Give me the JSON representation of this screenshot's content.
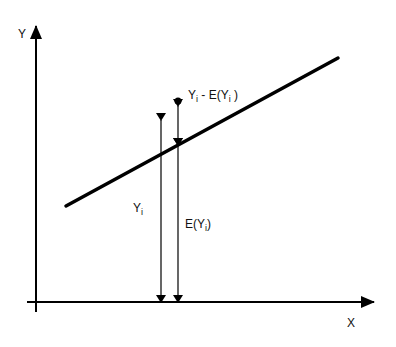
{
  "diagram": {
    "axes": {
      "y_label": "Y",
      "x_label": "X"
    },
    "regression_line": {
      "start": [
        66,
        206
      ],
      "end": [
        338,
        58
      ]
    },
    "observation_point": [
      178,
      101
    ],
    "labels": {
      "yi_main": "Y",
      "yi_sub": "i",
      "residual_prefix": "Y",
      "residual_sub1": "i",
      "residual_mid": " - E(Y",
      "residual_sub2": "i",
      "residual_suffix": " )",
      "expected_prefix": "E(Y",
      "expected_sub": "i",
      "expected_suffix": ")"
    }
  }
}
